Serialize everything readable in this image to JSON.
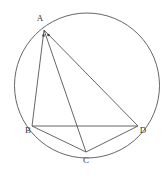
{
  "figure": {
    "type": "geometry-diagram",
    "background_color": "#ffffff",
    "stroke_color": "#555555",
    "label_color": "#3a3a3a",
    "stroke_width": 0.9,
    "canvas": {
      "width": 164,
      "height": 178
    }
  },
  "circle": {
    "name": "circumscribed-circle",
    "cx": 87,
    "cy": 85.5,
    "r": 72.5,
    "stroke": "#555555"
  },
  "points": [
    {
      "id": "A",
      "label": "A",
      "x": 44,
      "y": 30,
      "label_x": 40,
      "label_y": 19
    },
    {
      "id": "B",
      "label": "B",
      "x": 32,
      "y": 126,
      "label_x": 28,
      "label_y": 131
    },
    {
      "id": "C",
      "label": "C",
      "x": 86,
      "y": 152,
      "label_x": 86,
      "label_y": 161
    },
    {
      "id": "D",
      "label": "D",
      "x": 138,
      "y": 126,
      "label_x": 143,
      "label_y": 131
    }
  ],
  "segments": [
    {
      "id": "AB",
      "from": "A",
      "to": "B",
      "x1": 44,
      "y1": 30,
      "x2": 32,
      "y2": 126
    },
    {
      "id": "AC",
      "from": "A",
      "to": "C",
      "x1": 44,
      "y1": 30,
      "x2": 86,
      "y2": 152
    },
    {
      "id": "AD",
      "from": "A",
      "to": "D",
      "x1": 44,
      "y1": 30,
      "x2": 138,
      "y2": 126
    },
    {
      "id": "BC",
      "from": "B",
      "to": "C",
      "x1": 32,
      "y1": 126,
      "x2": 86,
      "y2": 152
    },
    {
      "id": "BD",
      "from": "B",
      "to": "D",
      "x1": 32,
      "y1": 126,
      "x2": 138,
      "y2": 126
    },
    {
      "id": "CD",
      "from": "C",
      "to": "D",
      "x1": 86,
      "y1": 152,
      "x2": 138,
      "y2": 126
    }
  ],
  "angle_marks": [
    {
      "id": "angle-BAC",
      "vertex": "A",
      "x": 43.5,
      "y": 35.5,
      "size": 2.2
    },
    {
      "id": "angle-CAD",
      "vertex": "A",
      "x": 48.5,
      "y": 35.0,
      "size": 2.2
    }
  ],
  "labels": {
    "A": "A",
    "B": "B",
    "C": "C",
    "D": "D"
  }
}
